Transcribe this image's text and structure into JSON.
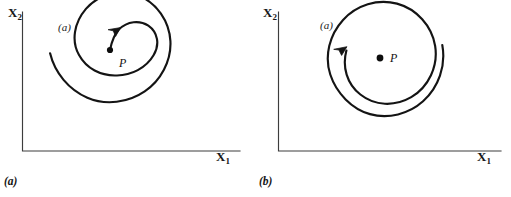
{
  "figure": {
    "background_color": "#ffffff",
    "ink_color": "#141414",
    "width": 511,
    "height": 197
  },
  "panels": [
    {
      "id": "a",
      "caption": "(a)",
      "inline_tag": "(a)",
      "axes": {
        "y_label_base": "X",
        "y_label_sub": "2",
        "x_label_base": "X",
        "x_label_sub": "1",
        "origin_x": 22,
        "origin_y": 151,
        "y_top": 12,
        "x_right": 240,
        "axis_color": "#3a3a3a"
      },
      "equilibrium": {
        "name": "P",
        "label": "P",
        "marker": "filled-dot",
        "cx": 110,
        "cy": 50,
        "radius": 3.1
      },
      "trajectory": {
        "type": "outward-spiral",
        "turns": 1.6,
        "tilt_degrees": -40,
        "inner_start": "P",
        "arrow_position": "inner-upper-left",
        "loop_separation": "wide",
        "stroke_width": 2.1
      }
    },
    {
      "id": "b",
      "caption": "(b)",
      "inline_tag": "(a)",
      "axes": {
        "y_label_base": "X",
        "y_label_sub": "2",
        "x_label_base": "X",
        "x_label_sub": "1",
        "origin_x": 23,
        "origin_y": 151,
        "y_top": 12,
        "x_right": 246,
        "axis_color": "#3a3a3a"
      },
      "equilibrium": {
        "name": "P",
        "label": "P",
        "marker": "filled-dot",
        "cx": 125,
        "cy": 58,
        "radius": 3.4
      },
      "trajectory": {
        "type": "near-closed-spiral",
        "turns": 1.9,
        "tilt_degrees": -42,
        "inner_start": "detached",
        "arrow_position": "inner-upper-left",
        "loop_separation": "tight",
        "stroke_width": 2.1
      }
    }
  ]
}
